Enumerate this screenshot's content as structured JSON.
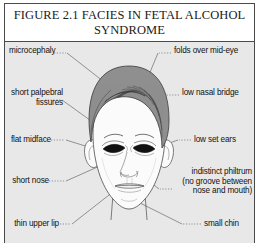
{
  "figure": {
    "title": "FIGURE 2.1 FACIES IN FETAL ALCOHOL\nSYNDROME",
    "border_color": "#4a4a4a",
    "background_color": "#e8e8e8",
    "title_background_color": "#ffffff"
  },
  "labels": {
    "left": [
      {
        "id": "microcephaly",
        "text": "microcephaly",
        "x": 8,
        "y": 6
      },
      {
        "id": "short-palpebral-fissures",
        "text": "short palpebral\nfissures",
        "x": 8,
        "y": 48
      },
      {
        "id": "flat-midface",
        "text": "flat midface",
        "x": 8,
        "y": 94
      },
      {
        "id": "short-nose",
        "text": "short nose",
        "x": 8,
        "y": 135
      },
      {
        "id": "thin-upper-lip",
        "text": "thin upper lip",
        "x": 8,
        "y": 178
      }
    ],
    "right": [
      {
        "id": "folds-over-mid-eye",
        "text": "folds over mid-eye",
        "x": 170,
        "y": 6
      },
      {
        "id": "low-nasal-bridge",
        "text": "low nasal bridge",
        "x": 178,
        "y": 48
      },
      {
        "id": "low-set-ears",
        "text": "low set ears",
        "x": 190,
        "y": 94
      },
      {
        "id": "indistinct-philtrum",
        "text": "indistinct philtrum\n(no groove between\nnose and mouth)",
        "x": 171,
        "y": 126
      },
      {
        "id": "small-chin",
        "text": "small chin",
        "x": 200,
        "y": 178
      }
    ]
  },
  "illustration": {
    "name": "child-face-frontal-view",
    "hair_color": "#8f8f8f",
    "hair_stroke_color": "#3a3a3a",
    "skin_color": "#fbfbfb",
    "eye_color": "#111111",
    "outline_color": "#4a4a4a",
    "leader_line_color": "#6a6a6a",
    "features": [
      "microcephalic-head",
      "epicanthal-folds",
      "short-palpebral-fissures",
      "flat-midface",
      "low-nasal-bridge",
      "short-nose",
      "indistinct-philtrum",
      "thin-upper-lip",
      "low-set-ears",
      "small-chin"
    ]
  }
}
